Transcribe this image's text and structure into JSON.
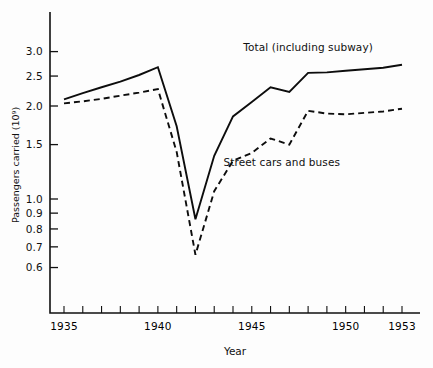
{
  "chart_data": {
    "type": "line",
    "title": "",
    "xlabel": "Year",
    "ylabel": "Passengers carried (10⁹)",
    "yscale": "log",
    "ylim": [
      0.55,
      3.45
    ],
    "xlim": [
      1934.3,
      1953.9
    ],
    "grid": false,
    "legend_position": "inline-annotation",
    "ytick_labels": [
      "3.0",
      "2.5",
      "2.0",
      "1.5",
      "1.0",
      "0.9",
      "0.8",
      "0.7",
      "0.6"
    ],
    "ytick_values": [
      3.0,
      2.5,
      2.0,
      1.5,
      1.0,
      0.9,
      0.8,
      0.7,
      0.6
    ],
    "xtick_values": [
      1935,
      1936,
      1937,
      1938,
      1939,
      1940,
      1941,
      1942,
      1943,
      1944,
      1945,
      1946,
      1947,
      1948,
      1949,
      1950,
      1951,
      1952,
      1953
    ],
    "xtick_labels": [
      {
        "value": 1935,
        "label": "1935"
      },
      {
        "value": 1940,
        "label": "1940"
      },
      {
        "value": 1945,
        "label": "1945"
      },
      {
        "value": 1950,
        "label": "1950"
      },
      {
        "value": 1953,
        "label": "1953"
      }
    ],
    "x": [
      1935,
      1936,
      1937,
      1938,
      1939,
      1940,
      1941,
      1942,
      1943,
      1944,
      1945,
      1946,
      1947,
      1948,
      1949,
      1950,
      1951,
      1952,
      1953
    ],
    "series": [
      {
        "name": "Total (including subway)",
        "style": "solid",
        "annotation": "Total (including subway)",
        "values": [
          2.1,
          2.2,
          2.3,
          2.4,
          2.52,
          2.67,
          1.72,
          0.86,
          1.38,
          1.85,
          2.06,
          2.3,
          2.22,
          2.56,
          2.57,
          2.6,
          2.63,
          2.66,
          2.72
        ]
      },
      {
        "name": "Street cars and buses",
        "style": "dashed",
        "annotation": "Street cars and buses",
        "values": [
          2.04,
          2.07,
          2.11,
          2.16,
          2.21,
          2.27,
          1.42,
          0.66,
          1.06,
          1.33,
          1.41,
          1.57,
          1.5,
          1.93,
          1.89,
          1.88,
          1.9,
          1.92,
          1.96
        ]
      }
    ],
    "annotations": [
      {
        "text": "Total (including subway)",
        "x": 1948.0,
        "y": 3.02
      },
      {
        "text": "Street cars and buses",
        "x": 1946.6,
        "y": 1.28
      }
    ]
  }
}
